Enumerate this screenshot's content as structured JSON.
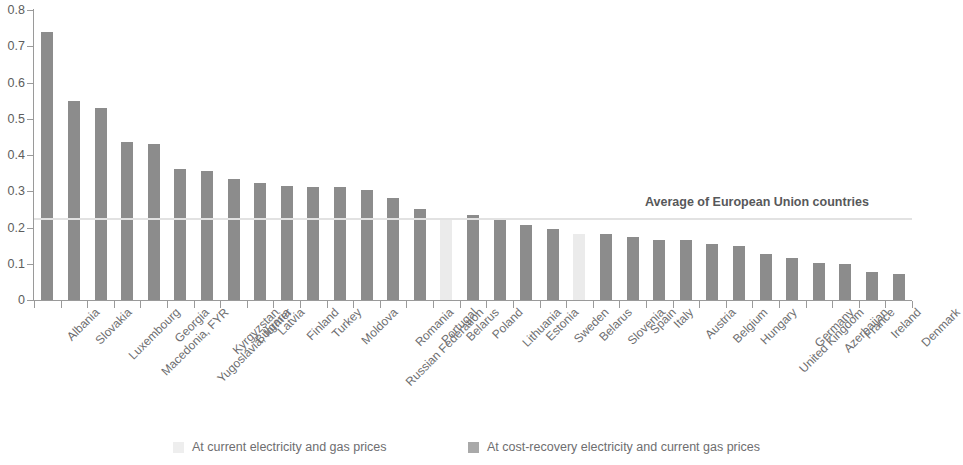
{
  "chart_data": {
    "type": "bar",
    "title": "",
    "subtitle": "",
    "xlabel": "",
    "ylabel": "",
    "ylim": [
      0,
      0.8
    ],
    "ytick_labels": [
      "0.8",
      "0.7",
      "0.6",
      "0.5",
      "0.4",
      "0.3",
      "0.2",
      "0.1",
      "0"
    ],
    "ytick_values": [
      0.8,
      0.7,
      0.6,
      0.5,
      0.4,
      0.3,
      0.2,
      0.1,
      0
    ],
    "grid": false,
    "legend_position": "bottom",
    "categories": [
      "Albania",
      "Slovakia",
      "Luxembourg",
      "Macedonia, FYR",
      "Georgia",
      "Yugoslavia, former",
      "Kyrgyzstan",
      "Bulgaria",
      "Latvia",
      "Finland",
      "Turkey",
      "Moldova",
      "Russian Federation",
      "Romania",
      "Portugal",
      "Belarus",
      "Poland",
      "Lithuania",
      "Estonia",
      "Sweden",
      "Belarus",
      "Slovenia",
      "Spain",
      "Italy",
      "Austria",
      "Belgium",
      "Hungary",
      "United Kingdom",
      "Germany",
      "Azerbaijan",
      "France",
      "Ireland",
      "Denmark"
    ],
    "values": [
      0.74,
      0.55,
      0.53,
      0.435,
      0.43,
      0.362,
      0.357,
      0.335,
      0.322,
      0.315,
      0.313,
      0.312,
      0.303,
      0.281,
      0.25,
      0.222,
      0.235,
      0.222,
      0.206,
      0.196,
      0.182,
      0.182,
      0.175,
      0.166,
      0.165,
      0.155,
      0.15,
      0.127,
      0.116,
      0.103,
      0.098,
      0.077,
      0.073
    ],
    "series_of_point": [
      "cost_recovery",
      "cost_recovery",
      "cost_recovery",
      "cost_recovery",
      "cost_recovery",
      "cost_recovery",
      "cost_recovery",
      "cost_recovery",
      "cost_recovery",
      "cost_recovery",
      "cost_recovery",
      "cost_recovery",
      "cost_recovery",
      "cost_recovery",
      "cost_recovery",
      "current",
      "cost_recovery",
      "cost_recovery",
      "cost_recovery",
      "cost_recovery",
      "current",
      "cost_recovery",
      "cost_recovery",
      "cost_recovery",
      "cost_recovery",
      "cost_recovery",
      "cost_recovery",
      "cost_recovery",
      "cost_recovery",
      "cost_recovery",
      "cost_recovery",
      "cost_recovery",
      "cost_recovery"
    ],
    "series": [
      {
        "name": "At current electricity and gas prices",
        "key": "current",
        "color": "#ebebeb"
      },
      {
        "name": "At cost-recovery electricity and current gas prices",
        "key": "cost_recovery",
        "color": "#8c8c8c"
      }
    ],
    "annotations": [
      {
        "text": "Average of European Union countries",
        "value": 0.223,
        "type": "hline",
        "color": "#e2e2e2"
      }
    ]
  },
  "legend": {
    "items": [
      {
        "label": "At current electricity and gas prices",
        "swatch": "light"
      },
      {
        "label": "At cost-recovery electricity and current gas prices",
        "swatch": "dark"
      }
    ]
  },
  "average_line": {
    "label": "Average of European Union countries",
    "value": 0.223
  },
  "colors": {
    "bar_dark": "#8c8c8c",
    "bar_light": "#ebebeb",
    "axis": "#9a9a9a",
    "average_line": "#e2e2e2",
    "text": "#6e6e70"
  }
}
